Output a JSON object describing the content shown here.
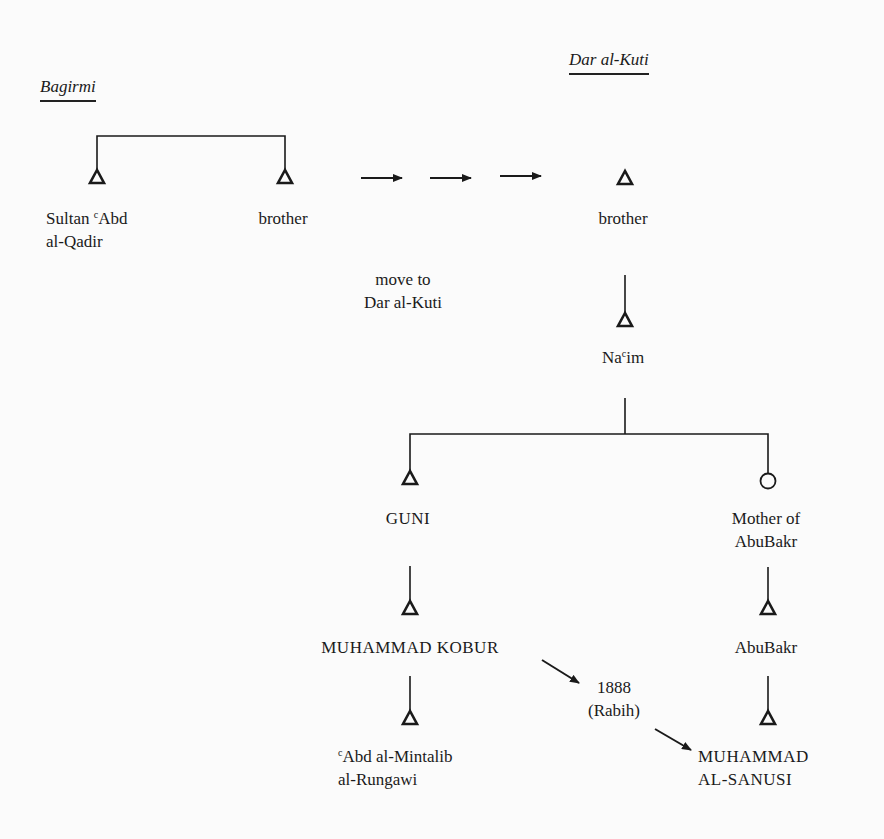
{
  "headers": {
    "left": "Bagirmi",
    "right": "Dar al-Kuti"
  },
  "nodes": {
    "sultan": {
      "sup": "c",
      "line1": "Sultan ",
      "line1b": "Abd",
      "line2": "al-Qadir",
      "symbol": "triangle"
    },
    "brother_bagirmi": {
      "label": "brother",
      "symbol": "triangle"
    },
    "brother_darkuti": {
      "label": "brother",
      "symbol": "triangle"
    },
    "nacim": {
      "pre": "Na",
      "sup": "c",
      "post": "im",
      "symbol": "triangle"
    },
    "guni": {
      "label": "GUNI",
      "symbol": "triangle"
    },
    "mother_abubakr": {
      "line1": "Mother of",
      "line2": "AbuBakr",
      "symbol": "circle"
    },
    "muhammad_kobur": {
      "label": "MUHAMMAD KOBUR",
      "symbol": "triangle"
    },
    "abubakr": {
      "label": "AbuBakr",
      "symbol": "triangle"
    },
    "abd_mintalib": {
      "sup": "c",
      "line1": "Abd al-Mintalib",
      "line2": "al-Rungawi",
      "symbol": "triangle"
    },
    "muhammad_sanusi": {
      "line1": "MUHAMMAD",
      "line2": "AL-SANUSI",
      "symbol": "triangle"
    }
  },
  "annotations": {
    "move": {
      "line1": "move to",
      "line2": "Dar al-Kuti"
    },
    "event": {
      "line1": "1888",
      "line2": "(Rabih)"
    }
  },
  "legend_symbols": {
    "triangle": "male",
    "circle": "female"
  },
  "colors": {
    "ink": "#1a1a1a",
    "paper": "#fbfbfb"
  }
}
